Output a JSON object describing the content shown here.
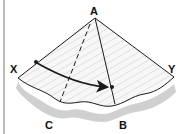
{
  "diagram": {
    "labels": {
      "apex": "A",
      "left": "X",
      "right": "Y",
      "bottom_right": "B",
      "bottom_left": "C"
    },
    "elements": {
      "surface": "cone-like folded surface with wavy lower edge and drop shadow",
      "dashed_line": "from A to C",
      "solid_line": "from A to B",
      "arrow": "curved arrow from point X to point on line AB"
    },
    "colors": {
      "stroke": "#1a1a1a",
      "fill": "#f4f4f4",
      "shadow": "#c8c8c8",
      "border": "#777777"
    }
  }
}
